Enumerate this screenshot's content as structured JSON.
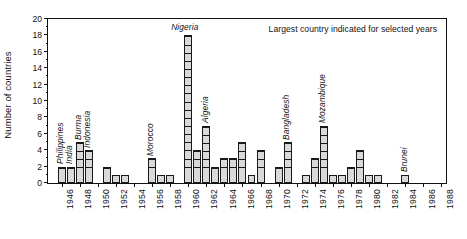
{
  "chart_data": {
    "type": "bar",
    "title": "",
    "subtitle": "",
    "xlabel": "",
    "ylabel": "Number of countries",
    "annotation": "Largest country indicated for selected years",
    "grid": false,
    "legend": "none",
    "xlim": [
      1945,
      1989
    ],
    "ylim": [
      0,
      20
    ],
    "ytick_step": 2,
    "ytick_labels": [
      "0",
      "2",
      "4",
      "6",
      "8",
      "10",
      "12",
      "14",
      "16",
      "18",
      "20"
    ],
    "xtick_labels": [
      "1946",
      "1948",
      "1950",
      "1952",
      "1954",
      "1956",
      "1958",
      "1960",
      "1962",
      "1964",
      "1966",
      "1968",
      "1970",
      "1972",
      "1974",
      "1976",
      "1978",
      "1980",
      "1982",
      "1984",
      "1986",
      "1988"
    ],
    "bar_style": "stacked unit squares, light grey fill, black outline",
    "bar_fill": "#d9d9d9",
    "bar_stroke": "#1a1a1a",
    "x": [
      1946,
      1947,
      1948,
      1949,
      1950,
      1951,
      1952,
      1953,
      1954,
      1955,
      1956,
      1957,
      1958,
      1959,
      1960,
      1961,
      1962,
      1963,
      1964,
      1965,
      1966,
      1967,
      1968,
      1969,
      1970,
      1971,
      1972,
      1973,
      1974,
      1975,
      1976,
      1977,
      1978,
      1979,
      1980,
      1981,
      1982,
      1983,
      1984,
      1985,
      1986,
      1987,
      1988
    ],
    "values": [
      2,
      2,
      5,
      4,
      0,
      2,
      1,
      1,
      0,
      0,
      3,
      1,
      1,
      0,
      18,
      4,
      7,
      2,
      3,
      3,
      5,
      1,
      4,
      0,
      2,
      5,
      0,
      1,
      3,
      7,
      1,
      1,
      2,
      4,
      1,
      1,
      0,
      0,
      1,
      0,
      0,
      0,
      0
    ],
    "annotations": [
      {
        "year": 1946,
        "label": "Philippines",
        "value": 2
      },
      {
        "year": 1947,
        "label": "India",
        "value": 2
      },
      {
        "year": 1948,
        "label": "Burma",
        "value": 5
      },
      {
        "year": 1949,
        "label": "Indonesia",
        "value": 4
      },
      {
        "year": 1956,
        "label": "Morocco",
        "value": 3
      },
      {
        "year": 1960,
        "label": "Nigeria",
        "value": 18
      },
      {
        "year": 1962,
        "label": "Algeria",
        "value": 7
      },
      {
        "year": 1971,
        "label": "Bangladesh",
        "value": 5
      },
      {
        "year": 1975,
        "label": "Mozambique",
        "value": 7
      },
      {
        "year": 1984,
        "label": "Brunei",
        "value": 1
      }
    ]
  }
}
